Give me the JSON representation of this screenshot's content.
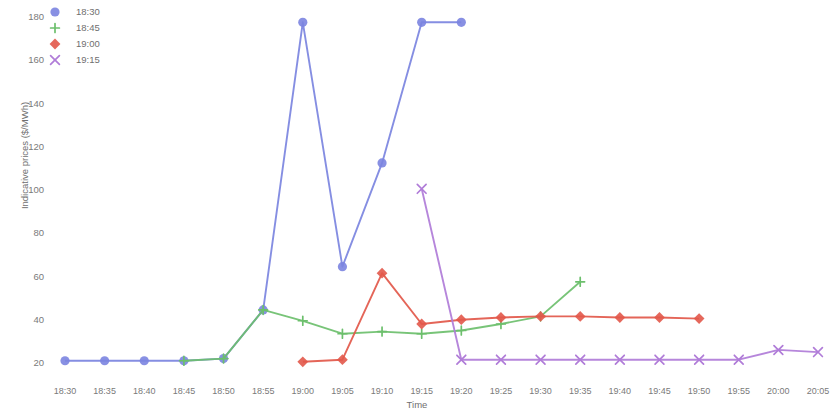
{
  "chart_data": {
    "type": "line",
    "title": "",
    "xlabel": "Time",
    "ylabel": "Indicative prices ($/MWh)",
    "x_tick_labels": [
      "18:30",
      "18:35",
      "18:40",
      "18:45",
      "18:50",
      "18:55",
      "19:00",
      "19:05",
      "19:10",
      "19:15",
      "19:20",
      "19:25",
      "19:30",
      "19:35",
      "19:40",
      "19:45",
      "19:50",
      "19:55",
      "20:00",
      "20:05"
    ],
    "y_tick_labels": [
      "20",
      "40",
      "60",
      "80",
      "100",
      "120",
      "140",
      "160",
      "180"
    ],
    "y_ticks": [
      20,
      40,
      60,
      80,
      100,
      120,
      140,
      160,
      180
    ],
    "ylim": [
      14,
      186
    ],
    "grid": false,
    "legend_position": "top-left",
    "series": [
      {
        "name": "18:30",
        "color": "#7b84e0",
        "marker": "circle",
        "x": [
          "18:30",
          "18:35",
          "18:40",
          "18:45",
          "18:50",
          "18:55",
          "19:00",
          "19:05",
          "19:10",
          "19:15",
          "19:20"
        ],
        "values": [
          21.5,
          21.5,
          21.5,
          21.5,
          22.5,
          45.0,
          178.0,
          65.0,
          113.0,
          178.0,
          178.0
        ]
      },
      {
        "name": "18:45",
        "color": "#6cbf6c",
        "marker": "plus",
        "x": [
          "18:45",
          "18:50",
          "18:55",
          "19:00",
          "19:05",
          "19:10",
          "19:15",
          "19:20",
          "19:25",
          "19:30",
          "19:35"
        ],
        "values": [
          21.5,
          22.5,
          45.0,
          40.0,
          34.0,
          35.0,
          34.0,
          35.5,
          38.5,
          42.0,
          58.0
        ]
      },
      {
        "name": "19:00",
        "color": "#e2584a",
        "marker": "diamond",
        "x": [
          "19:00",
          "19:05",
          "19:10",
          "19:15",
          "19:20",
          "19:25",
          "19:30",
          "19:35",
          "19:40",
          "19:45",
          "19:50"
        ],
        "values": [
          21.0,
          22.0,
          62.0,
          38.5,
          40.5,
          41.5,
          42.0,
          42.0,
          41.5,
          41.5,
          41.0
        ]
      },
      {
        "name": "19:15",
        "color": "#b07cd8",
        "marker": "x",
        "x": [
          "19:15",
          "19:20",
          "19:25",
          "19:30",
          "19:35",
          "19:40",
          "19:45",
          "19:50",
          "19:55",
          "20:00",
          "20:05"
        ],
        "values": [
          101.0,
          22.0,
          22.0,
          22.0,
          22.0,
          22.0,
          22.0,
          22.0,
          22.0,
          26.5,
          25.5
        ]
      }
    ]
  },
  "legend": {
    "items": [
      {
        "label": "18:30",
        "marker": "circle",
        "color": "#7b84e0"
      },
      {
        "label": "18:45",
        "marker": "plus",
        "color": "#6cbf6c"
      },
      {
        "label": "19:00",
        "marker": "diamond",
        "color": "#e2584a"
      },
      {
        "label": "19:15",
        "marker": "x",
        "color": "#b07cd8"
      }
    ]
  }
}
